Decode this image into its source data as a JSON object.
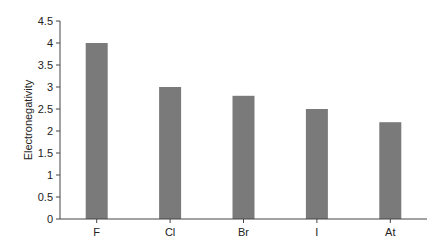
{
  "chart_data": {
    "type": "bar",
    "title": "",
    "xlabel": "",
    "ylabel": "Electronegativity",
    "categories": [
      "F",
      "Cl",
      "Br",
      "I",
      "At"
    ],
    "values": [
      4.0,
      3.0,
      2.8,
      2.5,
      2.2
    ],
    "ylim": [
      0,
      4.5
    ],
    "yticks": [
      "0",
      "0.5",
      "1",
      "1.5",
      "2",
      "2.5",
      "3",
      "3.5",
      "4",
      "4.5"
    ],
    "grid": false,
    "legend": null,
    "bar_color": "#7a7a7a",
    "axis_color": "#444444"
  }
}
